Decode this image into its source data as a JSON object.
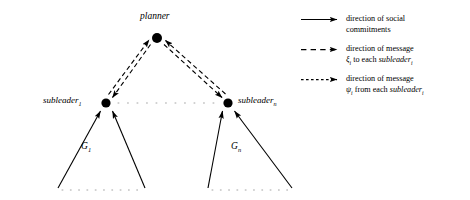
{
  "diagram": {
    "type": "hierarchical-agent-organization",
    "background_color": "#ffffff",
    "ink_color": "#000000",
    "nodes": [
      {
        "id": "planner",
        "label": "planner",
        "sub": "",
        "x": 157,
        "y": 38,
        "r": 5.0,
        "label_pos": "above"
      },
      {
        "id": "subleader1",
        "label": "subleader",
        "sub": "1",
        "x": 106,
        "y": 103,
        "r": 4.6,
        "label_pos": "left"
      },
      {
        "id": "subleadern",
        "label": "subleader",
        "sub": "n",
        "x": 228,
        "y": 103,
        "r": 4.6,
        "label_pos": "right"
      }
    ],
    "group_labels": [
      {
        "id": "g1",
        "label": "G",
        "sub": "1"
      },
      {
        "id": "gn",
        "label": "G",
        "sub": "n"
      }
    ]
  },
  "legend": {
    "entries": [
      {
        "id": "social-commitments",
        "marker": "solid-arrow",
        "line1": "direction of social",
        "line2": "commitments",
        "line2_symbol": "",
        "line2_suffix": ""
      },
      {
        "id": "message-xi",
        "marker": "dashed-arrow-long",
        "line1": "direction of message",
        "line2_symbol": "ξ",
        "line2_symbol_sub": "i",
        "line2_mid": " to each ",
        "line2_italic": "subleader",
        "line2_italic_sub": "i"
      },
      {
        "id": "message-psi",
        "marker": "dashed-arrow-short",
        "line1": "direction of message",
        "line2_symbol": "ψ",
        "line2_symbol_sub": "i",
        "line2_mid": " from each ",
        "line2_italic": "subleader",
        "line2_italic_sub": "i"
      }
    ]
  }
}
